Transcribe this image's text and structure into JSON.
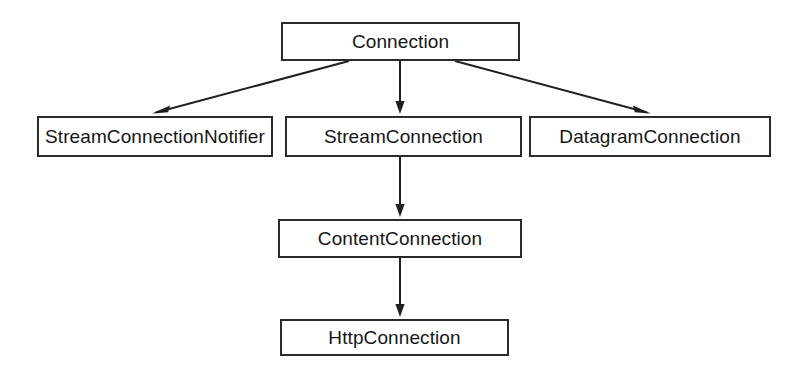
{
  "diagram": {
    "type": "class-hierarchy",
    "colors": {
      "box_border": "#2b2b2b",
      "box_fill": "#ffffff",
      "edge": "#1f1f1f",
      "text": "#161616",
      "background": "#fefefe"
    },
    "nodes": [
      {
        "id": "connection",
        "label": "Connection",
        "x": 281,
        "y": 22,
        "width": 239,
        "height": 39
      },
      {
        "id": "streamconnectionnotifier",
        "label": "StreamConnectionNotifier",
        "x": 37,
        "y": 116,
        "width": 236,
        "height": 41
      },
      {
        "id": "streamconnection",
        "label": "StreamConnection",
        "x": 285,
        "y": 116,
        "width": 237,
        "height": 41
      },
      {
        "id": "datagramconnection",
        "label": "DatagramConnection",
        "x": 529,
        "y": 116,
        "width": 242,
        "height": 41
      },
      {
        "id": "contentconnection",
        "label": "ContentConnection",
        "x": 278,
        "y": 219,
        "width": 244,
        "height": 39
      },
      {
        "id": "httpconnection",
        "label": "HttpConnection",
        "x": 280,
        "y": 319,
        "width": 229,
        "height": 37
      }
    ],
    "edges": [
      {
        "id": "edge-connection-to-streamconnectionnotifier",
        "from": "connection",
        "to": "streamconnectionnotifier",
        "style": "solid",
        "arrowhead": "open",
        "x1": 349,
        "y1": 61,
        "x2": 153,
        "y2": 113
      },
      {
        "id": "edge-connection-to-streamconnection",
        "from": "connection",
        "to": "streamconnection",
        "style": "solid",
        "arrowhead": "open",
        "x1": 400,
        "y1": 61,
        "x2": 400,
        "y2": 113
      },
      {
        "id": "edge-connection-to-datagramconnection",
        "from": "connection",
        "to": "datagramconnection",
        "style": "solid",
        "arrowhead": "open",
        "x1": 455,
        "y1": 61,
        "x2": 650,
        "y2": 113
      },
      {
        "id": "edge-streamconnection-to-contentconnection",
        "from": "streamconnection",
        "to": "contentconnection",
        "style": "solid",
        "arrowhead": "open",
        "x1": 400,
        "y1": 157,
        "x2": 400,
        "y2": 216
      },
      {
        "id": "edge-contentconnection-to-httpconnection",
        "from": "contentconnection",
        "to": "httpconnection",
        "style": "solid",
        "arrowhead": "open",
        "x1": 400,
        "y1": 258,
        "x2": 400,
        "y2": 316
      }
    ]
  }
}
